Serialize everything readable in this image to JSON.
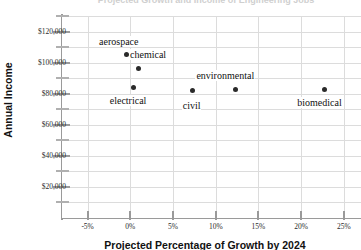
{
  "chart_data": {
    "type": "scatter",
    "title": "Projected Growth and Income of Engineering Jobs",
    "xlabel": "Projected Percentage of Growth by 2024",
    "ylabel": "Annual Income",
    "xlim": [
      -8.0,
      27.0
    ],
    "ylim": [
      0,
      130000
    ],
    "grid": true,
    "legend": "none",
    "x_ticks": [
      "-5%",
      "0%",
      "5%",
      "10%",
      "15%",
      "20%",
      "25%"
    ],
    "x_tick_values": [
      -5,
      0,
      5,
      10,
      15,
      20,
      25
    ],
    "y_ticks": [
      "$120,000",
      "$100,000",
      "$80,000",
      "$60,000",
      "$40,000",
      "$20,000"
    ],
    "y_tick_values": [
      120000,
      100000,
      80000,
      60000,
      40000,
      20000
    ],
    "y_minor_values": [
      130000,
      110000,
      90000,
      70000,
      50000,
      30000,
      10000
    ],
    "points": [
      {
        "label": "aerospace",
        "x": -0.5,
        "y": 105000
      },
      {
        "label": "chemical",
        "x": 0.9,
        "y": 96000
      },
      {
        "label": "electrical",
        "x": 0.4,
        "y": 84000
      },
      {
        "label": "civil",
        "x": 7.3,
        "y": 82000
      },
      {
        "label": "environmental",
        "x": 12.3,
        "y": 83000
      },
      {
        "label": "biomedical",
        "x": 22.7,
        "y": 83000
      }
    ]
  },
  "colors": {
    "point": "#2a2a2a",
    "grid": "#dcdcdc",
    "axis": "#9a9a9a",
    "text": "#111111"
  }
}
